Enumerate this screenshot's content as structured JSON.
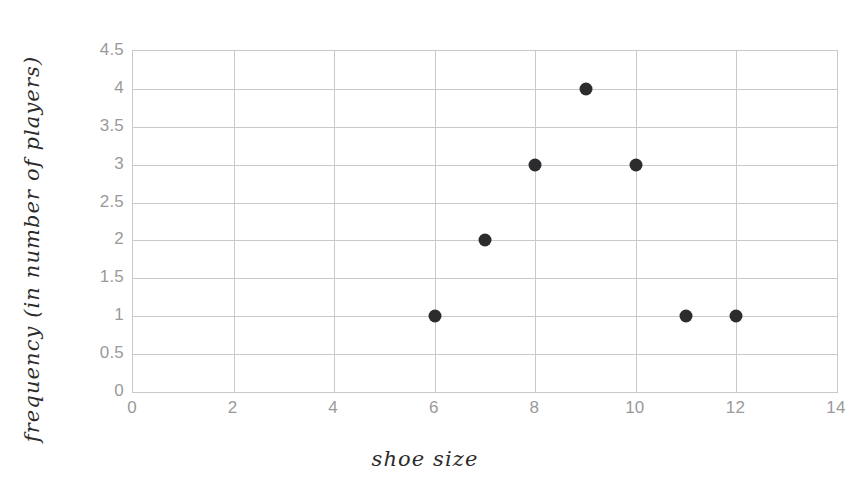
{
  "chart_data": {
    "type": "scatter",
    "title": "",
    "xlabel": "shoe size",
    "ylabel": "frequency (in number of players)",
    "xlim": [
      0,
      14
    ],
    "ylim": [
      0,
      4.5
    ],
    "grid": true,
    "legend": "none",
    "x": [
      6,
      7,
      8,
      9,
      10,
      11,
      12
    ],
    "y": [
      1,
      2,
      3,
      4,
      3,
      1,
      1
    ],
    "points": [
      {
        "x": 6,
        "y": 1
      },
      {
        "x": 7,
        "y": 2
      },
      {
        "x": 8,
        "y": 3
      },
      {
        "x": 9,
        "y": 4
      },
      {
        "x": 10,
        "y": 3
      },
      {
        "x": 11,
        "y": 1
      },
      {
        "x": 12,
        "y": 1
      }
    ],
    "xticks": [
      0,
      2,
      4,
      6,
      8,
      10,
      12,
      14
    ],
    "xtick_labels": [
      "0",
      "2",
      "4",
      "6",
      "8",
      "10",
      "12",
      "14"
    ],
    "yticks": [
      0,
      0.5,
      1,
      1.5,
      2,
      2.5,
      3,
      3.5,
      4,
      4.5
    ],
    "ytick_labels": [
      "0",
      "0.5",
      "1",
      "1.5",
      "2",
      "2.5",
      "3",
      "3.5",
      "4",
      "4.5"
    ],
    "colors": {
      "marker": "#2c2c2e",
      "gridline": "#c9c9c9",
      "frame": "#c9c9c9",
      "tick_label": "#9a9a9a",
      "axis_title": "#2b2b2b",
      "background": "#ffffff"
    }
  }
}
